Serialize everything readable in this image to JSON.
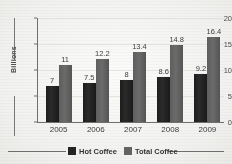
{
  "chart_data": {
    "type": "bar",
    "title": "",
    "xlabel": "",
    "ylabel": "Billions",
    "categories": [
      "2005",
      "2006",
      "2007",
      "2008",
      "2009"
    ],
    "series": [
      {
        "name": "Hot Coffee",
        "color": "#242424",
        "values": [
          7,
          7.5,
          8,
          8.6,
          9.2
        ],
        "labels": [
          "7",
          "7.5",
          "8",
          "8.6",
          "9.2"
        ]
      },
      {
        "name": "Total Coffee",
        "color": "#636363",
        "values": [
          11,
          12.2,
          13.4,
          14.8,
          16.4
        ],
        "labels": [
          "11",
          "12.2",
          "13.4",
          "14.8",
          "16.4"
        ]
      }
    ],
    "ylim": [
      0,
      20
    ],
    "yticks": [
      0,
      5,
      10,
      15,
      20
    ],
    "ytick_labels": [
      "0",
      "5",
      "10",
      "15",
      "20"
    ],
    "grid": true,
    "legend_position": "bottom",
    "data_labels": true
  },
  "axis": {
    "y_label": "Billions"
  },
  "legend": {
    "entries": [
      {
        "label": "Hot Coffee",
        "swatch": "dark"
      },
      {
        "label": "Total Coffee",
        "swatch": "gray"
      }
    ]
  }
}
